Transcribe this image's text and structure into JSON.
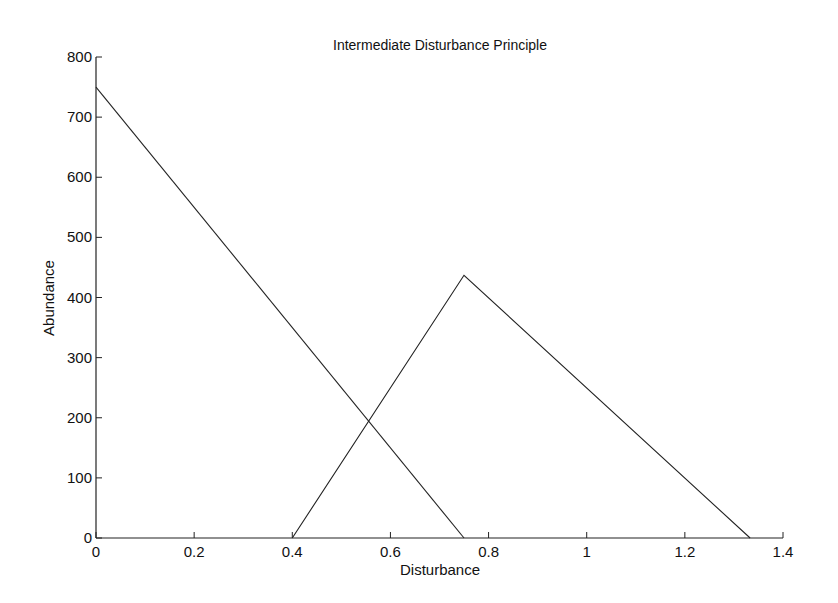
{
  "chart_data": {
    "type": "line",
    "title": "Intermediate Disturbance Principle",
    "xlabel": "Disturbance",
    "ylabel": "Abundance",
    "xlim": [
      0,
      1.4
    ],
    "ylim": [
      0,
      800
    ],
    "xticks": [
      0,
      0.2,
      0.4,
      0.6,
      0.8,
      1,
      1.2,
      1.4
    ],
    "xtick_labels": [
      "0",
      "0.2",
      "0.4",
      "0.6",
      "0.8",
      "1",
      "1.2",
      "1.4"
    ],
    "yticks": [
      0,
      100,
      200,
      300,
      400,
      500,
      600,
      700,
      800
    ],
    "ytick_labels": [
      "0",
      "100",
      "200",
      "300",
      "400",
      "500",
      "600",
      "700",
      "800"
    ],
    "grid": false,
    "legend": null,
    "series": [
      {
        "name": "line-1",
        "x": [
          0,
          0.75
        ],
        "y": [
          750,
          0
        ]
      },
      {
        "name": "line-2",
        "x": [
          0.4,
          0.75,
          1.333
        ],
        "y": [
          0,
          437,
          0
        ]
      }
    ]
  },
  "colors": {
    "line": "#222222",
    "axis": "#222222",
    "background": "#ffffff"
  }
}
